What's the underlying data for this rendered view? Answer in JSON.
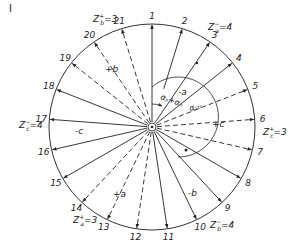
{
  "figure_marker": "I",
  "spokes": [
    {
      "n": "1",
      "style": "solid",
      "angle_deg": 0
    },
    {
      "n": "2",
      "style": "solid",
      "angle_deg": 17.14
    },
    {
      "n": "3",
      "style": "solid",
      "angle_deg": 34.29
    },
    {
      "n": "4",
      "style": "solid",
      "angle_deg": 51.43
    },
    {
      "n": "5",
      "style": "dashed",
      "angle_deg": 68.57
    },
    {
      "n": "6",
      "style": "dashed",
      "angle_deg": 85.71
    },
    {
      "n": "7",
      "style": "dashed",
      "angle_deg": 102.86
    },
    {
      "n": "8",
      "style": "solid",
      "angle_deg": 120
    },
    {
      "n": "9",
      "style": "solid",
      "angle_deg": 137.14
    },
    {
      "n": "10",
      "style": "solid",
      "angle_deg": 154.29
    },
    {
      "n": "11",
      "style": "solid",
      "angle_deg": 171.43
    },
    {
      "n": "12",
      "style": "dashed",
      "angle_deg": 188.57
    },
    {
      "n": "13",
      "style": "dashed",
      "angle_deg": 205.71
    },
    {
      "n": "14",
      "style": "dashed",
      "angle_deg": 222.86
    },
    {
      "n": "15",
      "style": "solid",
      "angle_deg": 240
    },
    {
      "n": "16",
      "style": "solid",
      "angle_deg": 257.14
    },
    {
      "n": "17",
      "style": "solid",
      "angle_deg": 274.29
    },
    {
      "n": "18",
      "style": "solid",
      "angle_deg": 291.43
    },
    {
      "n": "19",
      "style": "dashed",
      "angle_deg": 308.57
    },
    {
      "n": "20",
      "style": "dashed",
      "angle_deg": 325.71
    },
    {
      "n": "21",
      "style": "dashed",
      "angle_deg": 342.86
    }
  ],
  "group_labels": {
    "minus_a": "-a",
    "plus_a": "+a",
    "minus_b": "-b",
    "plus_b": "+b",
    "minus_c": "-c",
    "plus_c": "+c"
  },
  "counts": {
    "za_minus": {
      "base": "Z",
      "sub": "a",
      "sup": "−",
      "value": "=4"
    },
    "za_plus": {
      "base": "Z",
      "sub": "a",
      "sup": "+",
      "value": "=3"
    },
    "zb_minus": {
      "base": "Z",
      "sub": "b",
      "sup": "−",
      "value": "=4"
    },
    "zb_plus": {
      "base": "Z",
      "sub": "b",
      "sup": "+",
      "value": "=3"
    },
    "zc_minus": {
      "base": "Z",
      "sub": "c",
      "sup": "−",
      "value": "=4"
    },
    "zc_plus": {
      "base": "Z",
      "sub": "c",
      "sup": "+",
      "value": "=3"
    }
  },
  "angles": {
    "alpha_s_n": "αₛ+αₙ",
    "alpha_str": "αₛₜᵣ"
  }
}
